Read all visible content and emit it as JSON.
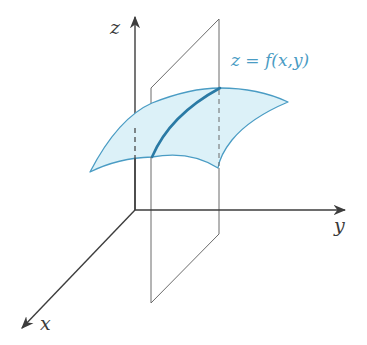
{
  "diagram": {
    "type": "3d-surface-with-vertical-plane",
    "labels": {
      "z_axis": "z",
      "y_axis": "y",
      "x_axis": "x",
      "surface": "z = f(x,y)"
    },
    "colors": {
      "axis": "#3d3d3d",
      "plane": "#6b6b6b",
      "surface_fill": "#dcf1f8",
      "surface_edge": "#4a9cc4",
      "trace_curve": "#2a7aa5",
      "formula_text": "#4a9cc4"
    },
    "elements": [
      "z-axis arrow (vertical)",
      "y-axis arrow (to the right)",
      "x-axis arrow (toward viewer, down-left)",
      "vertical plane parallel to xz-plane (y = constant)",
      "surface patch z = f(x,y)",
      "trace curve: intersection of plane and surface",
      "dashed projection lines from surface corners"
    ]
  }
}
